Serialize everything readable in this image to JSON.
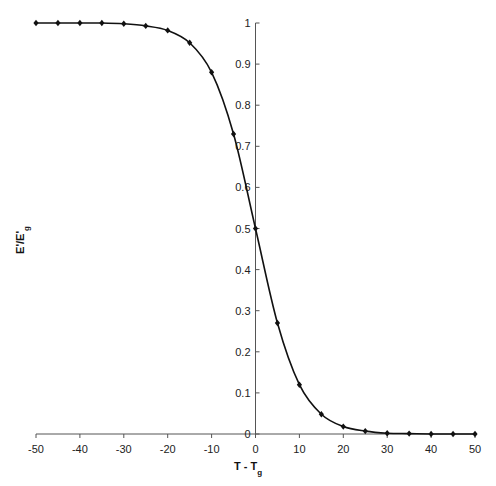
{
  "chart_data": {
    "type": "line",
    "title": "",
    "xlabel": "T - T",
    "xlabel_sub": "g",
    "ylabel": "E'/E'",
    "ylabel_sub": "g",
    "xlim": [
      -50,
      50
    ],
    "ylim": [
      0,
      1
    ],
    "x_ticks": [
      -50,
      -40,
      -30,
      -20,
      -10,
      0,
      10,
      20,
      30,
      40,
      50
    ],
    "y_ticks": [
      0,
      0.1,
      0.2,
      0.3,
      0.4,
      0.5,
      0.6,
      0.7,
      0.8,
      0.9,
      1
    ],
    "grid": false,
    "legend": "none",
    "series": [
      {
        "name": "E'/E'g",
        "marker": "diamond",
        "x": [
          -50,
          -45,
          -40,
          -35,
          -30,
          -25,
          -20,
          -15,
          -10,
          -5,
          0,
          5,
          10,
          15,
          20,
          25,
          30,
          35,
          40,
          45,
          50
        ],
        "values": [
          1.0,
          1.0,
          1.0,
          1.0,
          0.998,
          0.993,
          0.982,
          0.952,
          0.88,
          0.73,
          0.5,
          0.27,
          0.12,
          0.048,
          0.018,
          0.007,
          0.002,
          0.001,
          0.0,
          0.0,
          0.0
        ]
      }
    ]
  }
}
